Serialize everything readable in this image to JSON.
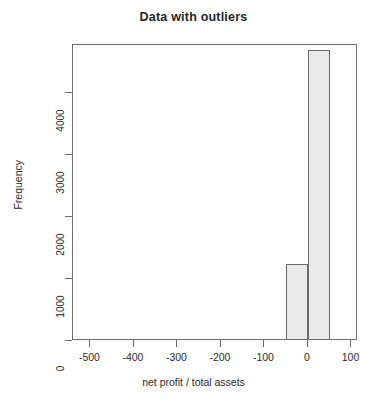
{
  "chart_data": {
    "type": "bar",
    "title": "Data with outliers",
    "xlabel": "net profit / total assets",
    "ylabel": "Frequency",
    "grid": false,
    "legend": "none",
    "xlim": [
      -540,
      115
    ],
    "ylim": [
      0,
      4780
    ],
    "xticks": [
      -500,
      -400,
      -300,
      -200,
      -100,
      0,
      100
    ],
    "xtick_labels": [
      "-500",
      "-400",
      "-300",
      "-200",
      "-100",
      "0",
      "100"
    ],
    "yticks": [
      0,
      1000,
      2000,
      3000,
      4000
    ],
    "ytick_labels": [
      "0",
      "1000",
      "2000",
      "3000",
      "4000"
    ],
    "bin_width": 50,
    "bars": [
      {
        "bin_start": -50,
        "bin_end": 0,
        "value": 1250
      },
      {
        "bin_start": 0,
        "bin_end": 50,
        "value": 4700
      }
    ],
    "baseline_value": 0,
    "colors": {
      "bar_fill": "#e9e9e9",
      "bar_stroke": "#6a6a6a",
      "axis": "#6e6e6e",
      "text": "#2b2b2b",
      "background": "#ffffff"
    }
  }
}
